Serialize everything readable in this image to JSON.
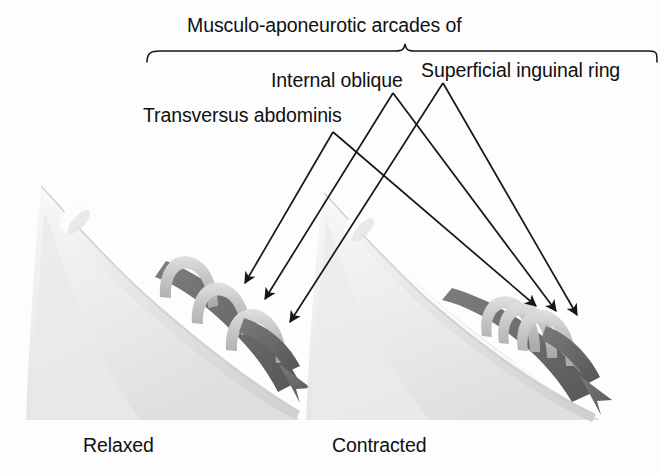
{
  "figure": {
    "width": 660,
    "height": 473,
    "background_color": "#fdfdfd"
  },
  "title": {
    "text": "Musculo-aponeurotic arcades of",
    "brace": {
      "left_x": 146,
      "right_x": 657,
      "y": 52,
      "apex_x": 405
    }
  },
  "labels": {
    "transversus_abdominis": "Transversus abdominis",
    "internal_oblique": "Internal oblique",
    "superficial_inguinal_ring": "Superficial inguinal ring"
  },
  "captions": {
    "left": "Relaxed",
    "right": "Contracted"
  },
  "colors": {
    "ink": "#101010",
    "leader_line": "#14161a",
    "muscle_fill_light": "#f1f1f1",
    "muscle_fill_mid": "#e2e2e2",
    "muscle_edge": "#c9c9c9",
    "arch_band": "#cfcfcf",
    "arch_band_shade": "#a9a9a9",
    "dark_arrow": "#6e6e6e",
    "dark_arrow_shade": "#585858"
  },
  "leaders": [
    {
      "name": "transversus-abdominis",
      "apex": [
        333,
        132
      ],
      "left_tip": [
        245,
        283
      ],
      "right_tip": [
        536,
        306
      ]
    },
    {
      "name": "internal-oblique",
      "apex": [
        393,
        93
      ],
      "left_tip": [
        265,
        299
      ],
      "right_tip": [
        556,
        311
      ]
    },
    {
      "name": "superficial-inguinal-ring",
      "apex": [
        443,
        83
      ],
      "left_tip": [
        290,
        320
      ],
      "right_tip": [
        577,
        315
      ]
    }
  ],
  "panels": [
    {
      "name": "relaxed",
      "caption": "Relaxed",
      "state": "relaxed",
      "arch_count": 3,
      "arches_spaced": true
    },
    {
      "name": "contracted",
      "caption": "Contracted",
      "state": "contracted",
      "arch_count": 3,
      "arches_spaced": false
    }
  ]
}
